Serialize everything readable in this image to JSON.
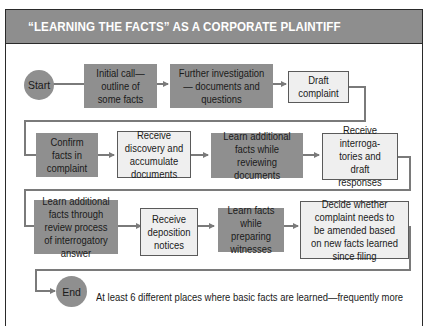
{
  "title": "“LEARNING THE FACTS” AS A CORPORATE PLAINTIFF",
  "colors": {
    "dark_box": "#8f8f8f",
    "light_box": "#efefef",
    "title_bar": "#8e8e8e",
    "connector": "#7a7a7a"
  },
  "start": {
    "label": "Start"
  },
  "end": {
    "label": "End"
  },
  "rows": [
    {
      "steps": [
        {
          "label": "Initial call— outline of some facts",
          "style": "dark"
        },
        {
          "label": "Further investigation— documents and questions",
          "style": "dark"
        },
        {
          "label": "Draft complaint",
          "style": "light"
        }
      ]
    },
    {
      "steps": [
        {
          "label": "Confirm facts in complaint",
          "style": "dark"
        },
        {
          "label": "Receive discovery and accumulate documents",
          "style": "light"
        },
        {
          "label": "Learn additional facts while reviewing documents",
          "style": "dark"
        },
        {
          "label": "Receive interroga-tories and draft responses",
          "style": "light"
        }
      ]
    },
    {
      "steps": [
        {
          "label": "Learn additional facts through review process of interrogatory answer",
          "style": "dark"
        },
        {
          "label": "Receive deposition notices",
          "style": "light"
        },
        {
          "label": "Learn facts while preparing witnesses",
          "style": "dark"
        },
        {
          "label": "Decide whether complaint needs to be amended based on new facts learned since filing",
          "style": "light"
        }
      ]
    }
  ],
  "note": "At least 6 different places where basic facts are learned—frequently more"
}
